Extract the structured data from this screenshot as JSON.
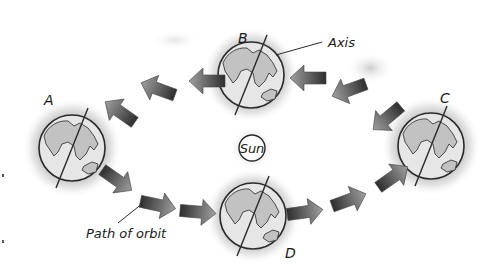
{
  "diagram": {
    "center": {
      "label": "Sun"
    },
    "positions": [
      {
        "id": "A",
        "label": "A"
      },
      {
        "id": "B",
        "label": "B"
      },
      {
        "id": "C",
        "label": "C"
      },
      {
        "id": "D",
        "label": "D"
      }
    ],
    "callouts": {
      "axis": "Axis",
      "orbit": "Path of orbit"
    },
    "colors": {
      "outline": "#2a2a2a",
      "globe_fill": "#e4e4e4",
      "land_fill": "#bdbdbd",
      "arrow_dark": "#333333",
      "arrow_light": "#9a9a9a",
      "haze": "#8a8a8a"
    }
  }
}
